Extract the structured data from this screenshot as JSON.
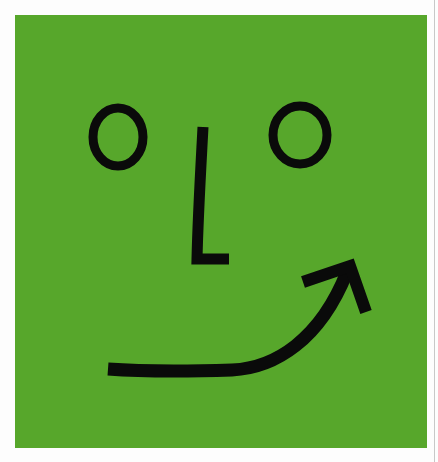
{
  "image": {
    "subject": "Green square with a hand-drawn smiley face",
    "description": "Two circular eyes, an L-shaped nose, and a smile drawn as a curved arrow pointing up-right",
    "colors": {
      "page_background": "#fdfdfd",
      "panel_green": "#57a72b",
      "ink": "#0a0a0a",
      "edge_line": "#c8c8c8"
    },
    "panel": {
      "x": 15,
      "y": 15,
      "width": 412,
      "height": 433
    },
    "features": {
      "left_eye": {
        "cx": 118,
        "cy": 137,
        "rx": 25,
        "ry": 29,
        "stroke": 9
      },
      "right_eye": {
        "cx": 300,
        "cy": 135,
        "rx": 27,
        "ry": 29,
        "stroke": 9
      },
      "nose": {
        "shape": "L",
        "stroke": 11
      },
      "smile": {
        "shape": "curved-arrow",
        "direction": "up-right",
        "stroke": 13
      }
    }
  }
}
